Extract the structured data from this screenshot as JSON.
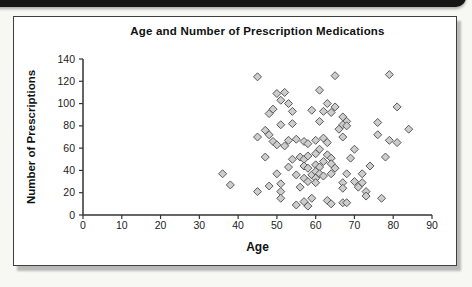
{
  "page": {
    "background_color": "#f7f7f4",
    "top_banner_color": "#161616",
    "frame_border_color": "#3f3f3f",
    "frame_shadow_color": "#b9b9b9"
  },
  "chart_data": {
    "type": "scatter",
    "title": "Age and Number of Prescription Medications",
    "xlabel": "Age",
    "ylabel": "Number of Prescriptions",
    "xlim": [
      0,
      90
    ],
    "ylim": [
      0,
      140
    ],
    "xticks": [
      0,
      10,
      20,
      30,
      40,
      50,
      60,
      70,
      80,
      90
    ],
    "yticks": [
      0,
      20,
      40,
      60,
      80,
      100,
      120,
      140
    ],
    "grid": false,
    "legend": "none",
    "marker": {
      "shape": "diamond",
      "fill": "#cdcdcd",
      "stroke": "#5a5a5a",
      "size": 8
    },
    "axis_color": "#333333",
    "tick_label_color": "#222222",
    "points": [
      [
        45,
        124
      ],
      [
        50,
        109
      ],
      [
        52,
        110
      ],
      [
        51,
        103
      ],
      [
        53,
        100
      ],
      [
        49,
        95
      ],
      [
        48,
        91
      ],
      [
        54,
        93
      ],
      [
        59,
        94
      ],
      [
        65,
        125
      ],
      [
        79,
        126
      ],
      [
        61,
        112
      ],
      [
        63,
        100
      ],
      [
        65,
        97
      ],
      [
        62,
        93
      ],
      [
        64,
        92
      ],
      [
        81,
        97
      ],
      [
        51,
        81
      ],
      [
        54,
        82
      ],
      [
        47,
        76
      ],
      [
        48,
        72
      ],
      [
        45,
        70
      ],
      [
        67,
        88
      ],
      [
        68,
        84
      ],
      [
        61,
        84
      ],
      [
        67,
        81
      ],
      [
        68,
        80
      ],
      [
        66,
        77
      ],
      [
        76,
        83
      ],
      [
        84,
        77
      ],
      [
        76,
        72
      ],
      [
        49,
        66
      ],
      [
        50,
        63
      ],
      [
        52,
        62
      ],
      [
        53,
        67
      ],
      [
        55,
        68
      ],
      [
        57,
        66
      ],
      [
        58,
        64
      ],
      [
        60,
        67
      ],
      [
        62,
        69
      ],
      [
        63,
        65
      ],
      [
        67,
        70
      ],
      [
        79,
        67
      ],
      [
        81,
        65
      ],
      [
        70,
        59
      ],
      [
        61,
        59
      ],
      [
        60,
        55
      ],
      [
        63,
        54
      ],
      [
        64,
        51
      ],
      [
        69,
        51
      ],
      [
        47,
        52
      ],
      [
        56,
        52
      ],
      [
        54,
        50
      ],
      [
        57,
        50
      ],
      [
        58,
        53
      ],
      [
        53,
        43
      ],
      [
        57,
        44
      ],
      [
        58,
        42
      ],
      [
        60,
        45
      ],
      [
        62,
        48
      ],
      [
        64,
        46
      ],
      [
        61,
        43
      ],
      [
        65,
        42
      ],
      [
        78,
        52
      ],
      [
        74,
        44
      ],
      [
        36,
        37
      ],
      [
        38,
        27
      ],
      [
        50,
        37
      ],
      [
        55,
        36
      ],
      [
        57,
        33
      ],
      [
        59,
        36
      ],
      [
        60,
        39
      ],
      [
        61,
        37
      ],
      [
        60,
        33
      ],
      [
        62,
        35
      ],
      [
        64,
        37
      ],
      [
        68,
        37
      ],
      [
        72,
        37
      ],
      [
        58,
        30
      ],
      [
        60,
        29
      ],
      [
        56,
        25
      ],
      [
        48,
        26
      ],
      [
        51,
        28
      ],
      [
        67,
        29
      ],
      [
        70,
        30
      ],
      [
        72,
        29
      ],
      [
        71,
        25
      ],
      [
        45,
        21
      ],
      [
        51,
        21
      ],
      [
        51,
        15
      ],
      [
        67,
        24
      ],
      [
        73,
        21
      ],
      [
        73,
        17
      ],
      [
        55,
        9
      ],
      [
        57,
        12
      ],
      [
        58,
        8
      ],
      [
        59,
        15
      ],
      [
        63,
        13
      ],
      [
        64,
        10
      ],
      [
        67,
        11
      ],
      [
        68,
        11
      ],
      [
        77,
        15
      ]
    ]
  }
}
